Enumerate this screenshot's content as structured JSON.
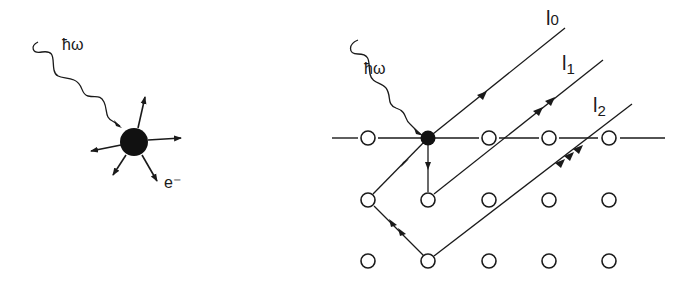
{
  "left_panel": {
    "photon_label": "ħω",
    "electron_label": "e⁻"
  },
  "right_panel": {
    "photon_label": "ħω",
    "path_labels": [
      {
        "id": "l0",
        "base": "l",
        "sub": "0"
      },
      {
        "id": "l1",
        "base": "l",
        "sub": "1"
      },
      {
        "id": "l2",
        "base": "l",
        "sub": "2"
      }
    ],
    "lattice": {
      "rows": 3,
      "cols": 5,
      "emitter": {
        "row": 0,
        "col": 1
      }
    }
  },
  "colors": {
    "ink": "#1a1a1a",
    "background": "#ffffff"
  }
}
